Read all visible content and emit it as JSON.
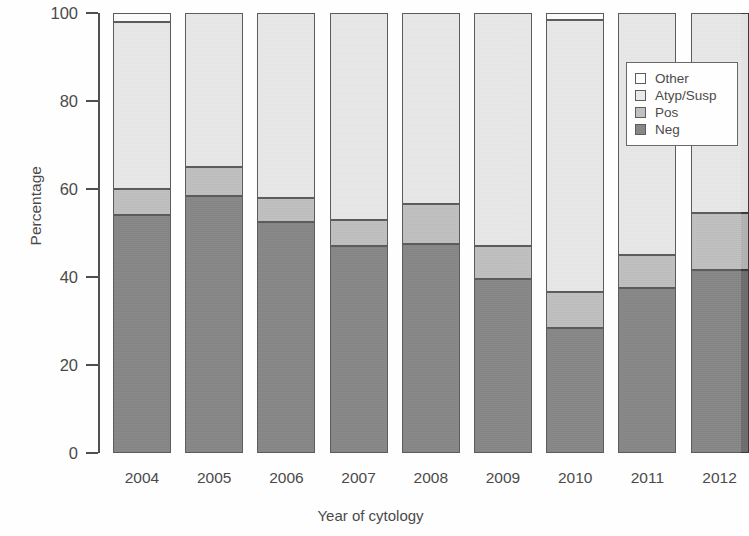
{
  "chart_data": {
    "type": "bar",
    "subtype": "stacked-percentage",
    "title": "",
    "xlabel": "Year of cytology",
    "ylabel": "Percentage",
    "categories": [
      "2004",
      "2005",
      "2006",
      "2007",
      "2008",
      "2009",
      "2010",
      "2011",
      "2012"
    ],
    "ylim": [
      0,
      100
    ],
    "yticks": [
      0,
      20,
      40,
      60,
      80,
      100
    ],
    "ytick_labels": [
      "0",
      "20",
      "40",
      "60",
      "80",
      "100"
    ],
    "grid": false,
    "legend_position": "top-right",
    "stack_order_bottom_to_top": [
      "Neg",
      "Pos",
      "Atyp/Susp",
      "Other"
    ],
    "series": [
      {
        "name": "Neg",
        "color": "#6e6e6e",
        "values": [
          54.0,
          58.5,
          52.5,
          47.0,
          47.5,
          39.5,
          28.5,
          37.5,
          41.5
        ]
      },
      {
        "name": "Pos",
        "color": "#b4b4b4",
        "values": [
          6.0,
          6.5,
          5.5,
          6.0,
          9.0,
          7.5,
          8.0,
          7.5,
          13.0
        ]
      },
      {
        "name": "Atyp/Susp",
        "color": "#e6e6e6",
        "values": [
          38.0,
          35.0,
          42.0,
          47.0,
          43.5,
          53.0,
          62.0,
          55.0,
          45.5
        ]
      },
      {
        "name": "Other",
        "color": "#ffffff",
        "values": [
          2.0,
          0.0,
          0.0,
          0.0,
          0.0,
          0.0,
          1.5,
          0.0,
          0.0
        ]
      }
    ]
  },
  "legend": {
    "items": [
      {
        "label": "Other",
        "color": "#ffffff"
      },
      {
        "label": "Atyp/Susp",
        "color": "#e6e6e6"
      },
      {
        "label": "Pos",
        "color": "#b4b4b4"
      },
      {
        "label": "Neg",
        "color": "#6e6e6e"
      }
    ]
  }
}
